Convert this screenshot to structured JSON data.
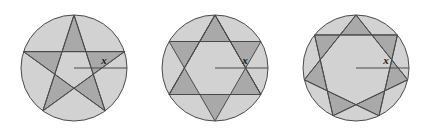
{
  "figure": {
    "name": "three-circles-with-inscribed-stars",
    "width": 423,
    "height": 136,
    "background_color": "#ffffff",
    "stroke_color": "#4a4a4a",
    "light_gray": "#d2d2d2",
    "dark_gray": "#a9a9a9",
    "label_color": "#1a1a1a"
  },
  "diagrams": [
    {
      "id": "circle-1",
      "name": "five-pointed-star-in-circle",
      "center_x": 74,
      "center_y": 68,
      "radius": 53,
      "star_points": 5,
      "star_step": 2,
      "start_angle_deg": -90,
      "radius_label": "x",
      "label_x": 104,
      "label_y": 64,
      "radius_line": {
        "x1": 74,
        "y1": 68,
        "x2": 127,
        "y2": 68
      }
    },
    {
      "id": "circle-2",
      "name": "six-pointed-star-in-circle",
      "center_x": 215,
      "center_y": 68,
      "radius": 53,
      "star_points": 6,
      "star_step": 2,
      "start_angle_deg": -90,
      "radius_label": "x",
      "label_x": 245,
      "label_y": 64,
      "radius_line": {
        "x1": 215,
        "y1": 68,
        "x2": 268,
        "y2": 68
      }
    },
    {
      "id": "circle-3",
      "name": "seven-pointed-star-in-circle",
      "center_x": 356,
      "center_y": 68,
      "radius": 53,
      "star_points": 7,
      "star_step": 2,
      "start_angle_deg": -90,
      "radius_label": "x",
      "label_x": 386,
      "label_y": 64,
      "radius_line": {
        "x1": 356,
        "y1": 68,
        "x2": 409,
        "y2": 68
      }
    }
  ]
}
